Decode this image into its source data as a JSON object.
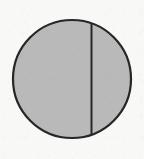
{
  "figure": {
    "title": "Circle divided by a vertical chord",
    "canvas": {
      "width": 144,
      "height": 159
    },
    "background_color": "#f8f8f7",
    "shapes": {
      "circle": {
        "name": "circle",
        "center_x": 72,
        "center_y": 79,
        "radius": 59,
        "fill_color": "#b9b9b9",
        "stroke_color": "#262626",
        "stroke_width": 2.2
      },
      "chord": {
        "name": "vertical-chord",
        "orientation": "vertical",
        "x": 91.5,
        "y_top": 23.5,
        "y_bottom": 134.5,
        "stroke_color": "#262626",
        "stroke_width": 2.0,
        "offset_from_center": 19.5
      }
    },
    "regions": [
      {
        "name": "major-segment-left",
        "side": "left",
        "fill_color": "#b9b9b9",
        "relative_size": "large"
      },
      {
        "name": "minor-segment-right",
        "side": "right",
        "fill_color": "#b9b9b9",
        "relative_size": "small"
      }
    ]
  }
}
